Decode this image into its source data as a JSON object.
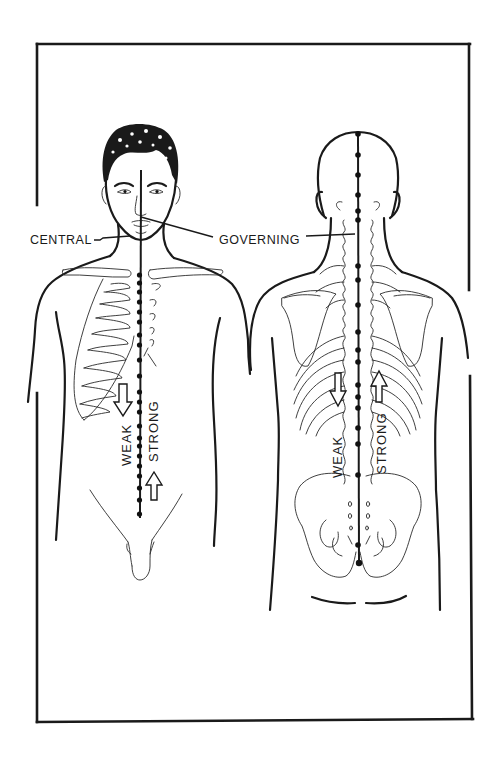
{
  "figure": {
    "colors": {
      "ink": "#1a1a1a",
      "background": "#ffffff"
    }
  },
  "labels": {
    "central": "CENTRAL",
    "governing": "GOVERNING"
  },
  "front_view": {
    "meridian": "central",
    "weak_label": "WEAK",
    "strong_label": "STRONG",
    "weak_arrow_direction": "down",
    "strong_arrow_direction": "up",
    "point_count": 17
  },
  "back_view": {
    "meridian": "governing",
    "weak_label": "WEAK",
    "strong_label": "STRONG",
    "weak_arrow_direction": "down",
    "strong_arrow_direction": "up",
    "point_count": 17
  },
  "icons": {
    "down_arrow": "hollow-arrow-down",
    "up_arrow": "hollow-arrow-up",
    "acupoint": "filled-dot"
  }
}
